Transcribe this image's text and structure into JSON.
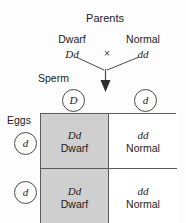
{
  "diagram": {
    "title": "Parents",
    "cross_symbol": "×",
    "parents": [
      {
        "phenotype": "Dwarf",
        "genotype": "Dd"
      },
      {
        "phenotype": "Normal",
        "genotype": "dd"
      }
    ],
    "gamete_rows": {
      "sperm": {
        "label": "Sperm",
        "alleles": [
          "D",
          "d"
        ]
      },
      "eggs": {
        "label": "Eggs",
        "alleles": [
          "d",
          "d"
        ]
      }
    },
    "punnett_cells": [
      {
        "genotype": "Dd",
        "phenotype": "Dwarf",
        "shaded": true
      },
      {
        "genotype": "dd",
        "phenotype": "Normal",
        "shaded": false
      },
      {
        "genotype": "Dd",
        "phenotype": "Dwarf",
        "shaded": true
      },
      {
        "genotype": "dd",
        "phenotype": "Normal",
        "shaded": false
      }
    ],
    "colors": {
      "shaded_cell": "#cfcfcf",
      "plain_cell": "#ffffff",
      "line": "#5a5a5a",
      "text": "#1d1d1d",
      "background": "#fdfdfd"
    }
  }
}
